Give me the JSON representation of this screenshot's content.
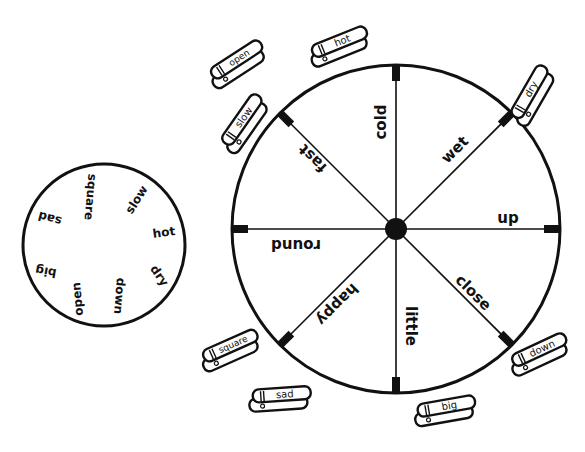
{
  "colors": {
    "ink": "#111111",
    "paper": "#ffffff"
  },
  "small_wheel": {
    "words": [
      "square",
      "slow",
      "hot",
      "dry",
      "down",
      "open",
      "big",
      "sad"
    ]
  },
  "big_wheel": {
    "segments": [
      "cold",
      "wet",
      "up",
      "close",
      "little",
      "happy",
      "round",
      "fast"
    ]
  },
  "clothespins": [
    {
      "label": "open"
    },
    {
      "label": "hot"
    },
    {
      "label": "slow"
    },
    {
      "label": "dry"
    },
    {
      "label": "square"
    },
    {
      "label": "sad"
    },
    {
      "label": "down"
    },
    {
      "label": "big"
    }
  ]
}
